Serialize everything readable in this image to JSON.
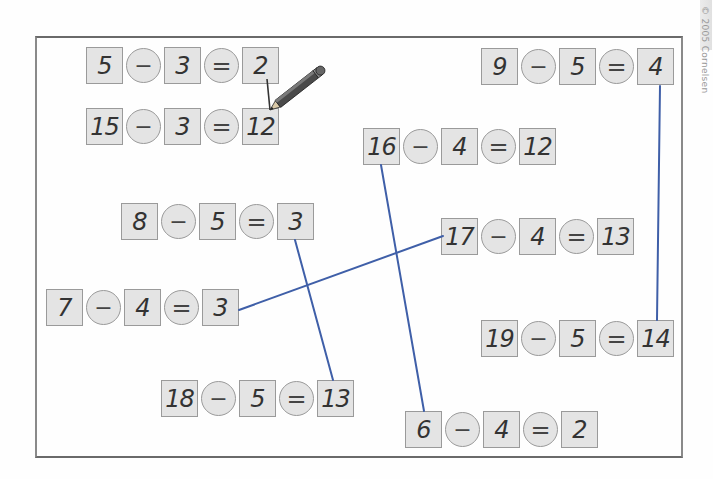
{
  "worksheet": {
    "copyright": "© 2005 Cornelsen",
    "line_color": "#3f5fa8",
    "box_fill": "#e4e4e4",
    "equations": [
      {
        "id": "eq1",
        "a": "5",
        "op": "−",
        "b": "3",
        "eq": "=",
        "result": "2",
        "x": 86,
        "y": 47
      },
      {
        "id": "eq2",
        "a": "15",
        "op": "−",
        "b": "3",
        "eq": "=",
        "result": "12",
        "x": 86,
        "y": 108
      },
      {
        "id": "eq3",
        "a": "9",
        "op": "−",
        "b": "5",
        "eq": "=",
        "result": "4",
        "x": 481,
        "y": 48
      },
      {
        "id": "eq4",
        "a": "16",
        "op": "−",
        "b": "4",
        "eq": "=",
        "result": "12",
        "x": 363,
        "y": 128
      },
      {
        "id": "eq5",
        "a": "8",
        "op": "−",
        "b": "5",
        "eq": "=",
        "result": "3",
        "x": 121,
        "y": 203
      },
      {
        "id": "eq6",
        "a": "17",
        "op": "−",
        "b": "4",
        "eq": "=",
        "result": "13",
        "x": 441,
        "y": 218
      },
      {
        "id": "eq7",
        "a": "7",
        "op": "−",
        "b": "4",
        "eq": "=",
        "result": "3",
        "x": 46,
        "y": 289
      },
      {
        "id": "eq8",
        "a": "19",
        "op": "−",
        "b": "5",
        "eq": "=",
        "result": "14",
        "x": 481,
        "y": 320
      },
      {
        "id": "eq9",
        "a": "18",
        "op": "−",
        "b": "5",
        "eq": "=",
        "result": "13",
        "x": 161,
        "y": 380
      },
      {
        "id": "eq10",
        "a": "6",
        "op": "−",
        "b": "4",
        "eq": "=",
        "result": "2",
        "x": 405,
        "y": 411
      }
    ],
    "connections": [
      {
        "from": "5-3=2 result 2",
        "to": "15-3=12 result 12",
        "style": "pencil example"
      },
      {
        "from": "9-5=4 result 4",
        "to": "19-5=14 result 14"
      },
      {
        "from": "16-4=12 minuend 16",
        "to": "6-4=2 minuend 6"
      },
      {
        "from": "8-5=3 result 3",
        "to": "18-5=13 result 13"
      },
      {
        "from": "7-4=3 result 3",
        "to": "17-4=13 minuend 17"
      }
    ]
  }
}
